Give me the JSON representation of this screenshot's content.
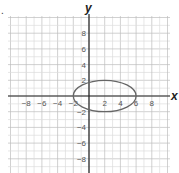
{
  "chart_data": {
    "type": "line",
    "title": "",
    "xlabel": "x",
    "ylabel": "y",
    "xlim": [
      -10,
      10
    ],
    "ylim": [
      -10,
      10
    ],
    "grid": true,
    "grid_step": 1,
    "x_ticks": [
      -8,
      -6,
      -4,
      -2,
      2,
      4,
      6,
      8
    ],
    "y_ticks": [
      8,
      6,
      4,
      2,
      -2,
      -4,
      -6,
      -8
    ],
    "x_tick_labels": [
      "−8",
      "−6",
      "−4",
      "−2",
      "2",
      "4",
      "6",
      "8"
    ],
    "y_tick_labels": [
      "8",
      "6",
      "4",
      "2",
      "−2",
      "−4",
      "−6",
      "−8"
    ],
    "series": [
      {
        "name": "ellipse",
        "shape": "ellipse",
        "center": [
          2,
          0
        ],
        "semi_axis_x": 4,
        "semi_axis_y": 2,
        "equation": "(x-2)^2/16 + y^2/4 = 1",
        "color": "#666666"
      }
    ]
  },
  "marker": "."
}
